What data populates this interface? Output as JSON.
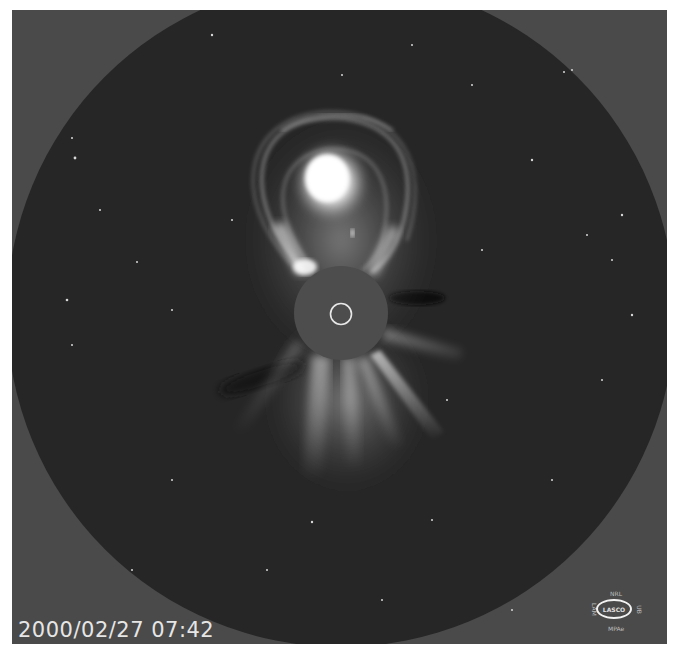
{
  "image": {
    "subject": "LASCO coronagraph view of a coronal mass ejection",
    "timestamp": "2000/02/27 07:42",
    "colors": {
      "background": "#4a4a4a",
      "sky_disk": "#262626",
      "occulter": "#4d4d4d",
      "sun_outline": "#e8e8e8",
      "cme_core": "#ffffff"
    }
  },
  "logo": {
    "top": "NRL",
    "center": "LASCO",
    "bottom": "MPAe",
    "left": "LAM",
    "right": "UB"
  }
}
